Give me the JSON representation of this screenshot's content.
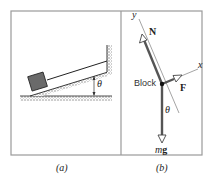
{
  "figure": {
    "panels": [
      {
        "id": "a",
        "caption": "(a)",
        "description": "Block on incline attached by cable to wall",
        "angle_label": "θ"
      },
      {
        "id": "b",
        "caption": "(b)",
        "description": "Free-body diagram of block",
        "axis_x": "x",
        "axis_y": "y",
        "normal_force": "N",
        "tension_force": "F",
        "weight_m": "m",
        "weight_g": "g",
        "body_label": "Block",
        "angle_label": "θ"
      }
    ],
    "colors": {
      "frame": "#9a9a9a",
      "line": "#222222",
      "vector": "#555555",
      "block": "#666666",
      "ground_hatch": "#888888"
    }
  }
}
